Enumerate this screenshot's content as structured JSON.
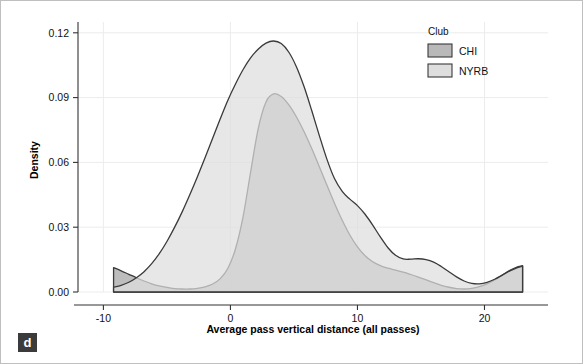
{
  "panel": {
    "label": "d"
  },
  "chart_data": {
    "type": "area",
    "title": "",
    "subtitle": "",
    "xlabel": "Average pass vertical distance (all passes)",
    "ylabel": "Density",
    "xlim": [
      -12.0,
      25.0
    ],
    "ylim": [
      0.0,
      0.125
    ],
    "xticks": [
      -10,
      0,
      10,
      20
    ],
    "xtick_labels": [
      "-10",
      "0",
      "10",
      "20"
    ],
    "yticks": [
      0.0,
      0.03,
      0.06,
      0.09,
      0.12
    ],
    "ytick_labels": [
      "0.00",
      "0.03",
      "0.06",
      "0.09",
      "0.12"
    ],
    "grid": "faint-horizontal-and-vertical",
    "legend": {
      "title": "Club",
      "position": "top-right",
      "entries": [
        {
          "name": "CHI",
          "label": "CHI",
          "color": "#b9b9b9",
          "edge": "#3a3a3a"
        },
        {
          "name": "NYRB",
          "label": "NYRB",
          "color": "#dedede",
          "edge": "#3a3a3a"
        }
      ]
    },
    "x": [
      -9.2,
      -8.6,
      -8.0,
      -7.4,
      -6.8,
      -6.2,
      -5.6,
      -5.0,
      -4.4,
      -3.8,
      -3.2,
      -2.6,
      -2.0,
      -1.4,
      -0.8,
      -0.2,
      0.4,
      1.0,
      1.6,
      2.2,
      2.8,
      3.4,
      4.0,
      4.6,
      5.2,
      5.8,
      6.4,
      7.0,
      7.6,
      8.2,
      8.8,
      9.4,
      10.0,
      10.6,
      11.2,
      11.8,
      12.4,
      13.0,
      13.6,
      14.2,
      14.8,
      15.4,
      16.0,
      16.6,
      17.2,
      17.8,
      18.4,
      19.0,
      19.6,
      20.2,
      20.8,
      21.4,
      22.0,
      22.6,
      23.0
    ],
    "series": [
      {
        "name": "CHI",
        "color": "#b9b9b9",
        "edge": "#3a3a3a",
        "values": [
          0.0113,
          0.0098,
          0.0082,
          0.0066,
          0.0051,
          0.0038,
          0.0028,
          0.0021,
          0.0016,
          0.0014,
          0.0014,
          0.0017,
          0.0024,
          0.0037,
          0.0062,
          0.011,
          0.02,
          0.035,
          0.056,
          0.076,
          0.088,
          0.0917,
          0.0905,
          0.0866,
          0.081,
          0.0742,
          0.0664,
          0.058,
          0.0494,
          0.041,
          0.0332,
          0.0264,
          0.0209,
          0.0168,
          0.014,
          0.0122,
          0.011,
          0.0101,
          0.0092,
          0.0081,
          0.0069,
          0.0056,
          0.0043,
          0.0031,
          0.0022,
          0.0016,
          0.0014,
          0.0017,
          0.0025,
          0.0038,
          0.0056,
          0.0078,
          0.01,
          0.0116,
          0.0122
        ]
      },
      {
        "name": "NYRB",
        "color": "#dedede",
        "edge": "#3a3a3a",
        "values": [
          0.0022,
          0.0031,
          0.0045,
          0.0066,
          0.0094,
          0.0131,
          0.0178,
          0.0234,
          0.0299,
          0.0371,
          0.045,
          0.0534,
          0.0622,
          0.0712,
          0.0802,
          0.0888,
          0.0963,
          0.103,
          0.1085,
          0.1125,
          0.1152,
          0.1162,
          0.115,
          0.111,
          0.1042,
          0.095,
          0.084,
          0.0724,
          0.0614,
          0.0524,
          0.0466,
          0.043,
          0.04,
          0.036,
          0.031,
          0.0255,
          0.0205,
          0.017,
          0.0153,
          0.0152,
          0.0154,
          0.015,
          0.0138,
          0.0118,
          0.0094,
          0.007,
          0.0051,
          0.004,
          0.0038,
          0.0045,
          0.0059,
          0.0078,
          0.0098,
          0.0113,
          0.012
        ]
      }
    ]
  }
}
